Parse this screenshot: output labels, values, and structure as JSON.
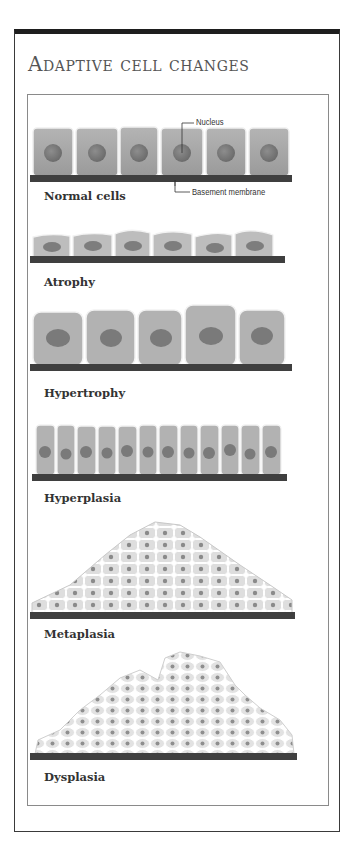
{
  "title": "Adaptive cell changes",
  "callouts": {
    "nucleus": "Nucleus",
    "basement_membrane": "Basement membrane"
  },
  "panels": [
    {
      "label": "Normal cells",
      "cell_count": 6
    },
    {
      "label": "Atrophy",
      "cell_count": 6
    },
    {
      "label": "Hypertrophy",
      "cell_count": 5
    },
    {
      "label": "Hyperplasia",
      "cell_count": 12
    },
    {
      "label": "Metaplasia"
    },
    {
      "label": "Dysplasia"
    }
  ],
  "colors": {
    "cell_fill": "#a9a9a9",
    "cell_highlight": "#e6e6e6",
    "nucleus": "#7c7c7c",
    "membrane": "#3f3f3f",
    "light_cell": "#dcdcdc"
  }
}
